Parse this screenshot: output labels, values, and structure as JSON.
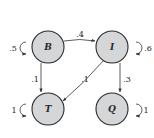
{
  "diagram": {
    "type": "markov-chain",
    "nodes": [
      {
        "id": "B",
        "label": "B"
      },
      {
        "id": "I",
        "label": "I"
      },
      {
        "id": "T",
        "label": "T"
      },
      {
        "id": "Q",
        "label": "Q"
      }
    ],
    "edges": [
      {
        "from": "B",
        "to": "B",
        "label": ".5"
      },
      {
        "from": "B",
        "to": "I",
        "label": ".4"
      },
      {
        "from": "B",
        "to": "T",
        "label": ".1"
      },
      {
        "from": "I",
        "to": "I",
        "label": ".6"
      },
      {
        "from": "I",
        "to": "T",
        "label": ".1"
      },
      {
        "from": "I",
        "to": "Q",
        "label": ".3"
      },
      {
        "from": "T",
        "to": "T",
        "label": "1"
      },
      {
        "from": "Q",
        "to": "Q",
        "label": "1"
      }
    ]
  }
}
